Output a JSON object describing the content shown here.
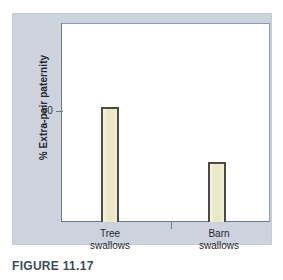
{
  "caption": "FIGURE 11.17",
  "colors": {
    "panel_background": "#ccd3dd",
    "plot_background": "#ffffff",
    "bar_fill": "#ece8c6",
    "bar_outline": "#4c4a42",
    "axis": "#6d7b90",
    "caption_text": "#3b4a5c"
  },
  "chart_data": {
    "type": "bar",
    "title": "",
    "xlabel": "",
    "ylabel": "% Extra-pair paternity",
    "categories": [
      "Tree swallows",
      "Barn swallows"
    ],
    "category_lines": [
      {
        "line1": "Tree",
        "line2": "swallows"
      },
      {
        "line1": "Barn",
        "line2": "swallows"
      }
    ],
    "values": [
      52,
      27
    ],
    "ylim": [
      0,
      90
    ],
    "ytick_labels": [
      "50"
    ],
    "yticks": [
      50
    ],
    "grid": false,
    "legend": "none",
    "series": [
      {
        "name": "Extra-pair paternity",
        "values": [
          52,
          27
        ]
      }
    ]
  }
}
